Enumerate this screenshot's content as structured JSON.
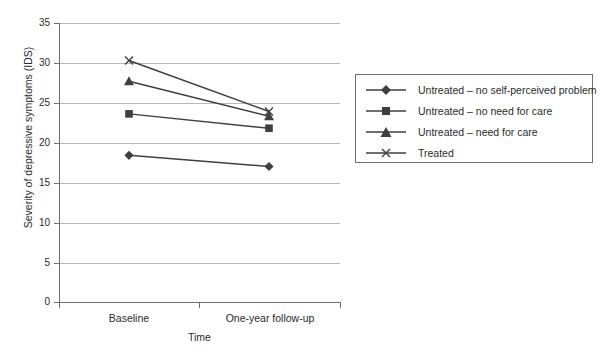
{
  "chart_data": {
    "type": "line",
    "title": "",
    "xlabel": "Time",
    "ylabel": "Severity of depressive symptoms (IDS)",
    "categories": [
      "Baseline",
      "One-year follow-up"
    ],
    "ylim": [
      0,
      35
    ],
    "yticks": [
      0,
      5,
      10,
      15,
      20,
      25,
      30,
      35
    ],
    "ytick_labels": [
      "0",
      "5",
      "10",
      "15",
      "20",
      "25",
      "30",
      "35"
    ],
    "grid": true,
    "legend_position": "right",
    "series": [
      {
        "name": "Untreated – no self-perceived problem",
        "marker": "diamond",
        "color": "#3f3f3f",
        "values": [
          18.4,
          17.0
        ]
      },
      {
        "name": "Untreated – no need for care",
        "marker": "square",
        "color": "#3f3f3f",
        "values": [
          23.6,
          21.8
        ]
      },
      {
        "name": "Untreated – need for care",
        "marker": "triangle",
        "color": "#3f3f3f",
        "values": [
          27.7,
          23.3
        ]
      },
      {
        "name": "Treated",
        "marker": "cross",
        "color": "#3f3f3f",
        "values": [
          30.3,
          23.9
        ]
      }
    ]
  },
  "axes": {
    "y_title": "Severity of depressive symptoms (IDS)",
    "x_title": "Time",
    "y_labels": [
      "35",
      "30",
      "25",
      "20",
      "15",
      "10",
      "5",
      "0"
    ],
    "x_labels": [
      "Baseline",
      "One-year follow-up"
    ]
  },
  "legend": {
    "items": [
      {
        "label": "Untreated – no self-perceived problem",
        "marker": "diamond"
      },
      {
        "label": "Untreated – no need for care",
        "marker": "square"
      },
      {
        "label": "Untreated – need for care",
        "marker": "triangle"
      },
      {
        "label": "Treated",
        "marker": "cross"
      }
    ]
  },
  "colors": {
    "series": "#3f3f3f",
    "grid": "#b9b9b9",
    "axis": "#6e6e6e",
    "text": "#2b2b2b",
    "background": "#ffffff"
  }
}
